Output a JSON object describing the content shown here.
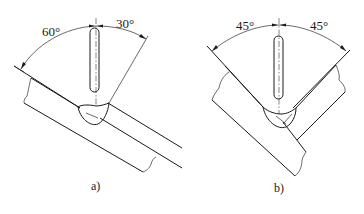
{
  "figures": [
    {
      "id": "a",
      "caption": "a)",
      "angle_left_label": "60°",
      "angle_right_label": "30°",
      "angle_left_deg": 60,
      "angle_right_deg": 30
    },
    {
      "id": "b",
      "caption": "b)",
      "angle_left_label": "45°",
      "angle_right_label": "45°",
      "angle_left_deg": 45,
      "angle_right_deg": 45
    }
  ]
}
